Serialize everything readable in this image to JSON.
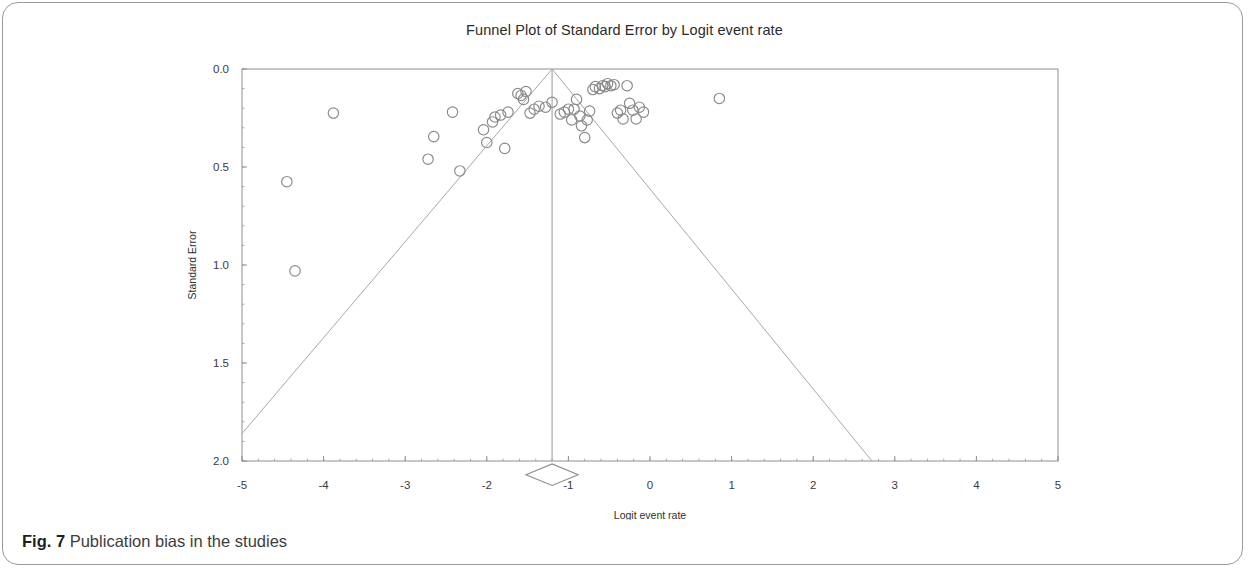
{
  "figure": {
    "caption_label": "Fig. 7",
    "caption_text": "Publication bias in the studies"
  },
  "chart_data": {
    "type": "scatter",
    "title": "Funnel Plot of Standard Error by Logit event rate",
    "xlabel": "Logit event rate",
    "ylabel": "Standard Error",
    "xlim": [
      -5,
      5
    ],
    "ylim": [
      0,
      2
    ],
    "y_inverted": true,
    "grid": false,
    "legend": "none",
    "xticks": [
      -5,
      -4,
      -3,
      -2,
      -1,
      0,
      1,
      2,
      3,
      4,
      5
    ],
    "xtick_labels": [
      "-5",
      "-4",
      "-3",
      "-2",
      "-1",
      "0",
      "1",
      "2",
      "3",
      "4",
      "5"
    ],
    "yticks": [
      0.0,
      0.5,
      1.0,
      1.5,
      2.0
    ],
    "ytick_labels": [
      "0.0",
      "0.5",
      "1.0",
      "1.5",
      "2.0"
    ],
    "marker": {
      "shape": "circle-open",
      "edge_color": "#8a8a8a",
      "fill": "none",
      "radius_px": 5.2
    },
    "center_line": {
      "x": -1.2,
      "label": "pooled effect",
      "color": "#9a9a9a"
    },
    "funnel_lines": {
      "apex": [
        -1.2,
        0.0
      ],
      "left_endpoint": [
        -5.0,
        1.86
      ],
      "right_endpoint": [
        2.72,
        2.0
      ],
      "color": "#a8a8a8",
      "description": "95% pseudo confidence limits"
    },
    "summary_diamond": {
      "x": -1.2,
      "y": 2.07,
      "half_width": 0.32,
      "half_height": 0.055,
      "color": "#8c8c8c",
      "label": "overall effect"
    },
    "points": [
      {
        "x": -4.45,
        "y": 0.575
      },
      {
        "x": -4.35,
        "y": 1.03
      },
      {
        "x": -3.88,
        "y": 0.225
      },
      {
        "x": -2.72,
        "y": 0.46
      },
      {
        "x": -2.65,
        "y": 0.345
      },
      {
        "x": -2.42,
        "y": 0.22
      },
      {
        "x": -2.33,
        "y": 0.52
      },
      {
        "x": -2.04,
        "y": 0.31
      },
      {
        "x": -2.0,
        "y": 0.375
      },
      {
        "x": -1.93,
        "y": 0.27
      },
      {
        "x": -1.9,
        "y": 0.245
      },
      {
        "x": -1.83,
        "y": 0.235
      },
      {
        "x": -1.78,
        "y": 0.405
      },
      {
        "x": -1.74,
        "y": 0.22
      },
      {
        "x": -1.62,
        "y": 0.125
      },
      {
        "x": -1.58,
        "y": 0.135
      },
      {
        "x": -1.55,
        "y": 0.155
      },
      {
        "x": -1.52,
        "y": 0.115
      },
      {
        "x": -1.47,
        "y": 0.225
      },
      {
        "x": -1.42,
        "y": 0.205
      },
      {
        "x": -1.36,
        "y": 0.19
      },
      {
        "x": -1.28,
        "y": 0.195
      },
      {
        "x": -1.2,
        "y": 0.17
      },
      {
        "x": -1.1,
        "y": 0.23
      },
      {
        "x": -1.05,
        "y": 0.22
      },
      {
        "x": -1.0,
        "y": 0.205
      },
      {
        "x": -0.96,
        "y": 0.26
      },
      {
        "x": -0.93,
        "y": 0.205
      },
      {
        "x": -0.9,
        "y": 0.155
      },
      {
        "x": -0.86,
        "y": 0.24
      },
      {
        "x": -0.84,
        "y": 0.29
      },
      {
        "x": -0.8,
        "y": 0.35
      },
      {
        "x": -0.77,
        "y": 0.26
      },
      {
        "x": -0.74,
        "y": 0.215
      },
      {
        "x": -0.7,
        "y": 0.105
      },
      {
        "x": -0.67,
        "y": 0.09
      },
      {
        "x": -0.62,
        "y": 0.1
      },
      {
        "x": -0.58,
        "y": 0.085
      },
      {
        "x": -0.55,
        "y": 0.09
      },
      {
        "x": -0.52,
        "y": 0.075
      },
      {
        "x": -0.48,
        "y": 0.085
      },
      {
        "x": -0.44,
        "y": 0.08
      },
      {
        "x": -0.4,
        "y": 0.225
      },
      {
        "x": -0.36,
        "y": 0.21
      },
      {
        "x": -0.33,
        "y": 0.255
      },
      {
        "x": -0.28,
        "y": 0.085
      },
      {
        "x": -0.25,
        "y": 0.175
      },
      {
        "x": -0.21,
        "y": 0.21
      },
      {
        "x": -0.17,
        "y": 0.255
      },
      {
        "x": -0.13,
        "y": 0.195
      },
      {
        "x": -0.08,
        "y": 0.22
      },
      {
        "x": 0.85,
        "y": 0.15
      }
    ]
  }
}
